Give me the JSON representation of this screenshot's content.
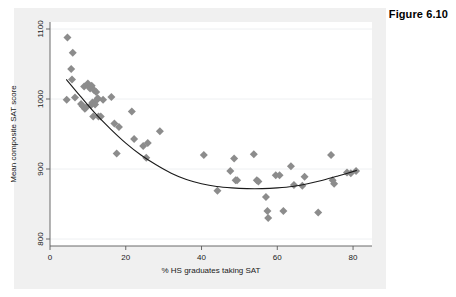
{
  "figure": {
    "label": "Figure 6.10"
  },
  "chart_data": {
    "type": "scatter",
    "title": "",
    "xlabel": "% HS graduates taking SAT",
    "ylabel": "Mean composite SAT score",
    "xlim": [
      0,
      85
    ],
    "ylim": [
      790,
      1110
    ],
    "xticks": [
      0,
      20,
      40,
      60,
      80
    ],
    "xtick_labels": [
      "0",
      "20",
      "40",
      "60",
      "80"
    ],
    "yticks": [
      800,
      900,
      1000,
      1100
    ],
    "ytick_labels": [
      "800",
      "900",
      "1000",
      "1100"
    ],
    "grid": "horizontal",
    "legend": "none",
    "marker": {
      "shape": "diamond",
      "color": "#8c8c8c",
      "size": 4
    },
    "fit": {
      "type": "quadratic",
      "color": "#1a1a1a",
      "label": "",
      "points": [
        [
          4.3,
          1028
        ],
        [
          8,
          1004
        ],
        [
          12,
          979
        ],
        [
          16,
          957
        ],
        [
          20,
          937
        ],
        [
          24,
          920
        ],
        [
          28,
          906
        ],
        [
          32,
          894
        ],
        [
          36,
          885
        ],
        [
          40,
          879
        ],
        [
          44,
          875
        ],
        [
          48,
          873
        ],
        [
          52,
          872
        ],
        [
          56,
          872
        ],
        [
          60,
          873
        ],
        [
          64,
          875
        ],
        [
          68,
          879
        ],
        [
          72,
          884
        ],
        [
          76,
          890
        ],
        [
          81,
          898
        ]
      ]
    },
    "points": [
      [
        4.6,
        1088
      ],
      [
        4.4,
        999
      ],
      [
        5.6,
        1043
      ],
      [
        5.8,
        1028
      ],
      [
        6.0,
        1066
      ],
      [
        6.6,
        1002
      ],
      [
        8.2,
        993
      ],
      [
        8.6,
        990
      ],
      [
        9.0,
        1018
      ],
      [
        9.2,
        986
      ],
      [
        9.5,
        988
      ],
      [
        10.0,
        1022
      ],
      [
        10.4,
        1017
      ],
      [
        10.6,
        1015
      ],
      [
        10.8,
        991
      ],
      [
        11.0,
        1019
      ],
      [
        11.2,
        995
      ],
      [
        11.4,
        975
      ],
      [
        11.6,
        1013
      ],
      [
        11.9,
        992
      ],
      [
        12.2,
        1010
      ],
      [
        12.4,
        999
      ],
      [
        12.6,
        1001
      ],
      [
        12.8,
        975
      ],
      [
        13.4,
        975
      ],
      [
        14.0,
        999
      ],
      [
        16.2,
        1003
      ],
      [
        17.0,
        965
      ],
      [
        17.6,
        922
      ],
      [
        18.2,
        960
      ],
      [
        21.6,
        982
      ],
      [
        22.2,
        943
      ],
      [
        24.6,
        933
      ],
      [
        25.4,
        916
      ],
      [
        25.8,
        937
      ],
      [
        29.0,
        954
      ],
      [
        40.6,
        920
      ],
      [
        44.2,
        869
      ],
      [
        47.6,
        897
      ],
      [
        48.6,
        915
      ],
      [
        49.0,
        884
      ],
      [
        49.4,
        884
      ],
      [
        53.8,
        921
      ],
      [
        54.6,
        884
      ],
      [
        55.0,
        882
      ],
      [
        57.0,
        860
      ],
      [
        57.4,
        840
      ],
      [
        57.6,
        830
      ],
      [
        59.6,
        891
      ],
      [
        60.6,
        891
      ],
      [
        61.6,
        840
      ],
      [
        63.6,
        904
      ],
      [
        64.4,
        877
      ],
      [
        66.6,
        876
      ],
      [
        67.2,
        889
      ],
      [
        70.8,
        838
      ],
      [
        74.2,
        920
      ],
      [
        74.6,
        884
      ],
      [
        75.0,
        879
      ],
      [
        78.4,
        895
      ],
      [
        79.4,
        894
      ],
      [
        80.8,
        897
      ]
    ]
  }
}
